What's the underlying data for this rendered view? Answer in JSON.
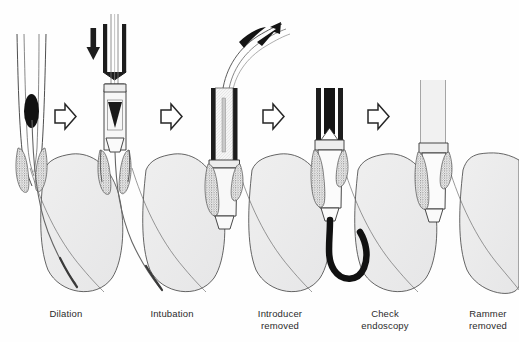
{
  "figure": {
    "background_color": "#fefefe",
    "ink_color": "#1a1a1a",
    "tissue_fill": "#ececed",
    "tumor_color": "#111111",
    "panel_count": 5,
    "connector_count": 4,
    "connector_icon": "arrow-right-outline-icon"
  },
  "panels": [
    {
      "id": "panel-dilation",
      "index": 1,
      "caption_lines": [
        "Dilation"
      ],
      "caption_x": 14,
      "caption_y": 308,
      "elements": [
        "esophagus-walls",
        "stricture-tumor",
        "guide-wire",
        "stomach",
        "tumor-stipple"
      ]
    },
    {
      "id": "panel-intubation",
      "index": 2,
      "caption_lines": [
        "Intubation"
      ],
      "caption_x": 120,
      "caption_y": 308,
      "elements": [
        "rammer-tube",
        "push-arrow-down",
        "stent-prosthesis",
        "guide-wire",
        "stomach",
        "tumor-stipple"
      ]
    },
    {
      "id": "panel-introducer-removed",
      "index": 3,
      "caption_lines": [
        "Introducer",
        "removed"
      ],
      "caption_x": 228,
      "caption_y": 308,
      "elements": [
        "rammer-tube",
        "introducer-withdrawn",
        "withdraw-arrow-up",
        "stent-prosthesis",
        "stomach",
        "tumor-stipple"
      ]
    },
    {
      "id": "panel-check-endoscopy",
      "index": 4,
      "caption_lines": [
        "Check",
        "endoscopy"
      ],
      "caption_x": 333,
      "caption_y": 308,
      "elements": [
        "rammer-tube",
        "endoscope",
        "stent-prosthesis",
        "stomach",
        "tumor-stipple"
      ]
    },
    {
      "id": "panel-rammer-removed",
      "index": 5,
      "caption_lines": [
        "Rammer",
        "removed"
      ],
      "caption_x": 436,
      "caption_y": 308,
      "elements": [
        "esophagus-walls",
        "stent-prosthesis",
        "stomach",
        "tumor-stipple"
      ]
    }
  ],
  "connectors": [
    {
      "id": "connector-1",
      "x": 55,
      "y": 104,
      "label": "arrow-right-outline-icon"
    },
    {
      "id": "connector-2",
      "x": 161,
      "y": 104,
      "label": "arrow-right-outline-icon"
    },
    {
      "id": "connector-3",
      "x": 263,
      "y": 104,
      "label": "arrow-right-outline-icon"
    },
    {
      "id": "connector-4",
      "x": 368,
      "y": 104,
      "label": "arrow-right-outline-icon"
    }
  ],
  "annotation_arrows": [
    {
      "id": "push-arrow-down",
      "direction": "down",
      "panel": 2,
      "style": "solid-black"
    },
    {
      "id": "withdraw-arrow-up",
      "direction": "up-right",
      "panel": 3,
      "style": "solid-black"
    }
  ]
}
